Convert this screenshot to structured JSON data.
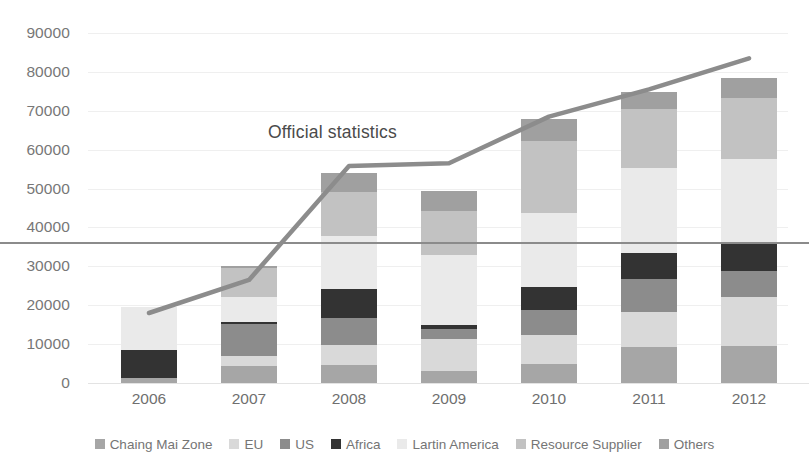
{
  "annotation": {
    "text": "Official statistics",
    "x": 268,
    "y": 122
  },
  "chart_data": {
    "type": "bar",
    "title": "",
    "subtitle": "",
    "xlabel": "",
    "ylabel": "",
    "stacked": true,
    "grid": true,
    "legend_position": "bottom",
    "ylim": [
      0,
      90000
    ],
    "ytick_labels": [
      "0",
      "10000",
      "20000",
      "30000",
      "40000",
      "50000",
      "60000",
      "70000",
      "80000",
      "90000"
    ],
    "ytick_values": [
      0,
      10000,
      20000,
      30000,
      40000,
      50000,
      60000,
      70000,
      80000,
      90000
    ],
    "categories": [
      "2006",
      "2007",
      "2008",
      "2009",
      "2010",
      "2011",
      "2012"
    ],
    "series": [
      {
        "name": "Chaing Mai Zone",
        "color": "#a6a6a6",
        "values": [
          1200,
          4300,
          4700,
          3000,
          4800,
          9200,
          9500
        ]
      },
      {
        "name": "EU",
        "color": "#d9d9d9",
        "values": [
          0,
          2700,
          5000,
          8400,
          7500,
          9000,
          12500
        ]
      },
      {
        "name": "US",
        "color": "#8c8c8c",
        "values": [
          0,
          8200,
          7000,
          2600,
          6500,
          8500,
          6700
        ]
      },
      {
        "name": "Africa",
        "color": "#333333",
        "values": [
          7200,
          400,
          7500,
          800,
          6000,
          6700,
          7000
        ]
      },
      {
        "name": "Lartin America",
        "color": "#eaeaea",
        "values": [
          11200,
          6400,
          13500,
          18000,
          19000,
          22000,
          22000
        ]
      },
      {
        "name": "Resource Supplier",
        "color": "#c2c2c2",
        "values": [
          0,
          7700,
          11500,
          11500,
          18500,
          15000,
          15500
        ]
      },
      {
        "name": "Others",
        "color": "#a0a0a0",
        "values": [
          0,
          300,
          4800,
          5200,
          5700,
          4500,
          5300
        ]
      }
    ],
    "totals": [
      19600,
      30000,
      54000,
      49500,
      68000,
      74900,
      78500
    ],
    "line_series": {
      "name": "Official statistics",
      "color": "#8c8c8c",
      "values": [
        18000,
        26500,
        55800,
        56500,
        68500,
        75500,
        83500
      ]
    },
    "reference_line": {
      "value": 36000,
      "color": "#8b8b8b"
    }
  }
}
